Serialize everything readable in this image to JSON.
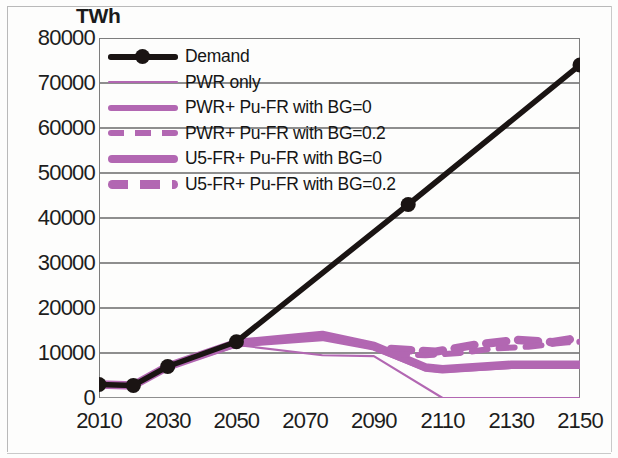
{
  "chart_data": {
    "type": "line",
    "title": "",
    "subtitle": "",
    "xlabel": "",
    "ylabel": "TWh",
    "unit_label": "TWh",
    "xlim": [
      2010,
      2150
    ],
    "ylim": [
      0,
      80000
    ],
    "x_ticks": [
      "2010",
      "2030",
      "2050",
      "2070",
      "2090",
      "2110",
      "2130",
      "2150"
    ],
    "x_tick_values": [
      2010,
      2030,
      2050,
      2070,
      2090,
      2110,
      2130,
      2150
    ],
    "y_ticks": [
      "0",
      "10000",
      "20000",
      "30000",
      "40000",
      "50000",
      "60000",
      "70000",
      "80000"
    ],
    "y_tick_values": [
      0,
      10000,
      20000,
      30000,
      40000,
      50000,
      60000,
      70000,
      80000
    ],
    "grid": true,
    "grid_axis": "y",
    "legend_position": "top-left",
    "colors": {
      "demand": "#1a1413",
      "purple": "#b267b2",
      "purple_light": "#bb7dbb",
      "grid": "#8e8e8e",
      "axis": "#7d7d7d",
      "text": "#1d1d1d"
    },
    "series": [
      {
        "name": "Demand",
        "style": "solid-thick-marker",
        "color": "#1a1413",
        "markers": true,
        "x": [
          2010,
          2020,
          2030,
          2050,
          2100,
          2150
        ],
        "values": [
          3000,
          2800,
          7000,
          12500,
          43000,
          74000
        ]
      },
      {
        "name": "PWR only",
        "style": "solid-thin",
        "color": "#b267b2",
        "markers": false,
        "x": [
          2010,
          2020,
          2030,
          2050,
          2075,
          2090,
          2110,
          2150
        ],
        "values": [
          3000,
          2800,
          7000,
          11800,
          9500,
          9300,
          0,
          0
        ]
      },
      {
        "name": "PWR+ Pu-FR with BG=0",
        "style": "solid-medium",
        "color": "#b267b2",
        "markers": false,
        "x": [
          2010,
          2020,
          2030,
          2050,
          2075,
          2090,
          2105,
          2110,
          2130,
          2150
        ],
        "values": [
          3000,
          2800,
          7000,
          11900,
          13300,
          11200,
          6600,
          6200,
          7100,
          7100
        ]
      },
      {
        "name": "PWR+ Pu-FR with BG=0.2",
        "style": "dashed-medium",
        "color": "#b267b2",
        "markers": false,
        "x": [
          2095,
          2105,
          2115,
          2125,
          2135,
          2145,
          2150
        ],
        "values": [
          9800,
          9500,
          10000,
          11000,
          11400,
          12300,
          12500
        ]
      },
      {
        "name": "U5-FR+ Pu-FR with BG=0",
        "style": "solid-thick",
        "color": "#b267b2",
        "markers": false,
        "x": [
          2010,
          2020,
          2030,
          2050,
          2075,
          2090,
          2105,
          2110,
          2130,
          2150
        ],
        "values": [
          3000,
          2800,
          7000,
          12200,
          14000,
          11600,
          6800,
          6400,
          7400,
          7400
        ]
      },
      {
        "name": "U5-FR+ Pu-FR with BG=0.2",
        "style": "dashed-thick",
        "color": "#b267b2",
        "markers": false,
        "x": [
          2095,
          2108,
          2120,
          2132,
          2142,
          2150
        ],
        "values": [
          10900,
          10300,
          11900,
          12900,
          12400,
          13400
        ]
      }
    ],
    "legend": [
      {
        "label": "Demand",
        "style": "solid-thick-marker",
        "color": "#1a1413"
      },
      {
        "label": "PWR only",
        "style": "solid-thin",
        "color": "#b267b2"
      },
      {
        "label": "PWR+ Pu-FR with BG=0",
        "style": "solid-medium",
        "color": "#b267b2"
      },
      {
        "label": "PWR+ Pu-FR with BG=0.2",
        "style": "dashed-medium",
        "color": "#b267b2"
      },
      {
        "label": " U5-FR+ Pu-FR with BG=0",
        "style": "solid-thick",
        "color": "#b267b2"
      },
      {
        "label": "U5-FR+ Pu-FR with BG=0.2",
        "style": "dashed-thick",
        "color": "#b267b2"
      }
    ]
  }
}
